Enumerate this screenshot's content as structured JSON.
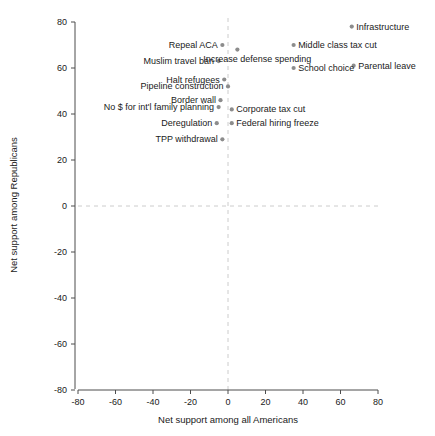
{
  "chart_data": {
    "type": "scatter",
    "title": "",
    "xlabel": "Net support among all Americans",
    "ylabel": "Net support among Republicans",
    "xlim": [
      -80,
      80
    ],
    "ylim": [
      -80,
      80
    ],
    "xticks": [
      "-80",
      "-60",
      "-40",
      "-20",
      "0",
      "20",
      "40",
      "60",
      "80"
    ],
    "yticks": [
      "-80",
      "-60",
      "-40",
      "-20",
      "0",
      "20",
      "40",
      "60",
      "80"
    ],
    "xtick_values": [
      -80,
      -60,
      -40,
      -20,
      0,
      20,
      40,
      60,
      80
    ],
    "ytick_values": [
      -80,
      -60,
      -40,
      -20,
      0,
      20,
      40,
      60,
      80
    ],
    "grid": false,
    "zero_reference_lines": true,
    "legend": "none",
    "marker_color": "#8c8c8c",
    "axis_color": "#4d4d4d",
    "reference_line_color": "#cccccc",
    "points": [
      {
        "label": "Infrastructure",
        "x": 66,
        "y": 78,
        "label_pos": "right"
      },
      {
        "label": "Repeal ACA",
        "x": -3,
        "y": 70,
        "label_pos": "left"
      },
      {
        "label": "Middle class tax cut",
        "x": 35,
        "y": 70,
        "label_pos": "right"
      },
      {
        "label": "Increase defense spending",
        "x": 5,
        "y": 68,
        "label_pos": "below-right"
      },
      {
        "label": "Muslim travel ban",
        "x": -5,
        "y": 63,
        "label_pos": "left"
      },
      {
        "label": "Parental leave",
        "x": 67,
        "y": 61,
        "label_pos": "right"
      },
      {
        "label": "School choice",
        "x": 35,
        "y": 60,
        "label_pos": "right"
      },
      {
        "label": "Halt refugees",
        "x": -2,
        "y": 55,
        "label_pos": "left"
      },
      {
        "label": "Pipeline construction",
        "x": 0,
        "y": 52,
        "label_pos": "left"
      },
      {
        "label": "Border wall",
        "x": -4,
        "y": 46,
        "label_pos": "left"
      },
      {
        "label": "No $ for int'l family planning",
        "x": -5,
        "y": 43,
        "label_pos": "left"
      },
      {
        "label": "Corporate tax cut",
        "x": 2,
        "y": 42,
        "label_pos": "right"
      },
      {
        "label": "Deregulation",
        "x": -6,
        "y": 36,
        "label_pos": "left"
      },
      {
        "label": "Federal hiring freeze",
        "x": 2,
        "y": 36,
        "label_pos": "right"
      },
      {
        "label": "TPP withdrawal",
        "x": -3,
        "y": 29,
        "label_pos": "left"
      }
    ]
  }
}
